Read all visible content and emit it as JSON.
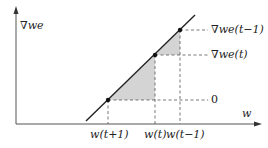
{
  "diagram": {
    "axes": {
      "y_label": "∇we",
      "x_label": "w"
    },
    "right_labels": [
      {
        "id": "grad_t_minus_1",
        "text": "∇we(t−1)"
      },
      {
        "id": "grad_t",
        "text": "∇we(t)"
      },
      {
        "id": "zero",
        "text": "0"
      }
    ],
    "bottom_labels": [
      {
        "id": "w_t_plus_1",
        "text": "w(t+1)"
      },
      {
        "id": "w_t",
        "text": "w(t)"
      },
      {
        "id": "w_t_minus_1",
        "text": "w(t−1)"
      }
    ],
    "colors": {
      "line": "#222222",
      "axis": "#555555",
      "dash": "#555555",
      "shade": "#d4d4d4"
    }
  }
}
